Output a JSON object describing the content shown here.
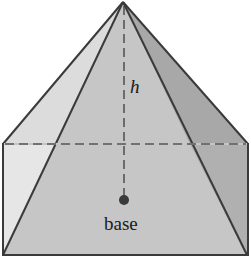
{
  "diagram": {
    "type": "pyramid-in-box",
    "labels": {
      "height": "h",
      "base": "base"
    },
    "colors": {
      "left_face": "#dedede",
      "front_face": "#c4c4c4",
      "right_face": "#a9a9a9",
      "edge": "#3a3a3a",
      "dashed_line": "#555555",
      "point": "#3a3a3a"
    }
  }
}
